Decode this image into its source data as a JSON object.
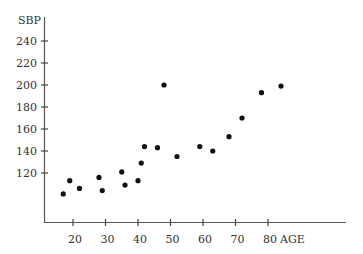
{
  "chart_data": {
    "type": "scatter",
    "title": "",
    "xlabel": "AGE",
    "ylabel": "SBP",
    "x_ticks": [
      20,
      30,
      40,
      50,
      60,
      70,
      80
    ],
    "y_ticks": [
      120,
      140,
      160,
      180,
      200,
      220,
      240
    ],
    "xlim": [
      8,
      102
    ],
    "ylim": [
      75,
      254
    ],
    "grid": false,
    "legend": null,
    "series": [
      {
        "name": "SBP vs AGE",
        "color": "#111111",
        "points": [
          {
            "x": 17,
            "y": 101
          },
          {
            "x": 19,
            "y": 113
          },
          {
            "x": 22,
            "y": 106
          },
          {
            "x": 28,
            "y": 116
          },
          {
            "x": 29,
            "y": 104
          },
          {
            "x": 35,
            "y": 121
          },
          {
            "x": 36,
            "y": 109
          },
          {
            "x": 40,
            "y": 113
          },
          {
            "x": 41,
            "y": 129
          },
          {
            "x": 42,
            "y": 144
          },
          {
            "x": 46,
            "y": 143
          },
          {
            "x": 48,
            "y": 200
          },
          {
            "x": 52,
            "y": 135
          },
          {
            "x": 59,
            "y": 144
          },
          {
            "x": 63,
            "y": 140
          },
          {
            "x": 68,
            "y": 153
          },
          {
            "x": 72,
            "y": 170
          },
          {
            "x": 78,
            "y": 193
          },
          {
            "x": 84,
            "y": 199
          }
        ]
      }
    ]
  },
  "axes": {
    "x_label": "AGE",
    "y_label": "SBP",
    "color": "#555555"
  }
}
